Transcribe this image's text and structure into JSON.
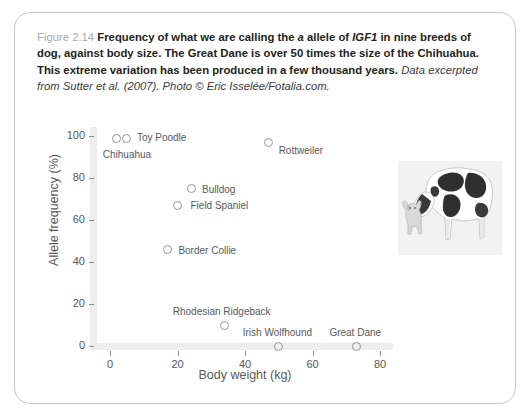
{
  "figure": {
    "number_label": "Figure 2.14",
    "caption_bold_1": "Frequency of what we are calling the ",
    "caption_italic_a": "a",
    "caption_bold_2": " allele of ",
    "caption_italic_gene": "IGF1",
    "caption_bold_3": " in nine breeds of dog, against body size. The Great Dane is over 50 times the size of the Chihuahua. This extreme variation has been produced in a few thousand years. ",
    "caption_source": "Data excerpted from Sutter et al. (2007). Photo © Eric Isselée/Fotalia.com.",
    "photo_alt": "great-dane-and-chihuahua-photo"
  },
  "chart_data": {
    "type": "scatter",
    "title": "",
    "xlabel": "Body weight (kg)",
    "ylabel": "Allele frequency (%)",
    "xlim": [
      -5,
      88
    ],
    "ylim": [
      -5,
      104
    ],
    "xticks": [
      0,
      20,
      40,
      60,
      80
    ],
    "yticks": [
      0,
      20,
      40,
      60,
      80,
      100
    ],
    "grid": false,
    "legend": "none",
    "points": [
      {
        "name": "Chihuahua",
        "x": 2,
        "y": 99,
        "label_dx": -14,
        "label_dy": 16
      },
      {
        "name": "Toy Poodle",
        "x": 5,
        "y": 99,
        "label_dx": 10,
        "label_dy": -1
      },
      {
        "name": "Rottweiler",
        "x": 47,
        "y": 97,
        "label_dx": 10,
        "label_dy": 8
      },
      {
        "name": "Bulldog",
        "x": 24,
        "y": 75,
        "label_dx": 11,
        "label_dy": 0
      },
      {
        "name": "Field Spaniel",
        "x": 20,
        "y": 67,
        "label_dx": 13,
        "label_dy": 0
      },
      {
        "name": "Border Collie",
        "x": 17,
        "y": 46,
        "label_dx": 11,
        "label_dy": 1
      },
      {
        "name": "Rhodesian Ridgeback",
        "x": 34,
        "y": 10,
        "label_dx": -52,
        "label_dy": -14
      },
      {
        "name": "Irish Wolfhound",
        "x": 50,
        "y": 0,
        "label_dx": -36,
        "label_dy": -14
      },
      {
        "name": "Great Dane",
        "x": 73,
        "y": 0,
        "label_dx": -27,
        "label_dy": -14
      }
    ]
  },
  "colors": {
    "axis_band": "#ededee",
    "point_stroke": "#939598",
    "text": "#58595b",
    "caption_text": "#231f20",
    "fig_number": "#a7a9ac",
    "card_border": "#c9cacc"
  }
}
